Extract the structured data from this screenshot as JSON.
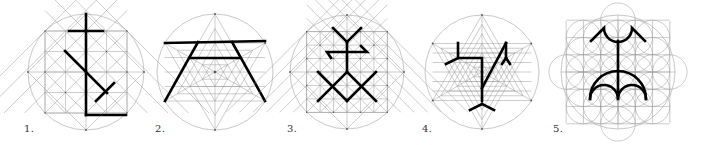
{
  "figures": [
    {
      "id": 1,
      "label": "1.",
      "cx": 86,
      "cy": 72,
      "r": 58,
      "construction": "octagonal-square-grid",
      "label_pos": [
        24,
        123
      ]
    },
    {
      "id": 2,
      "label": "2.",
      "cx": 215,
      "cy": 72,
      "r": 58,
      "construction": "hexagram-triangular-grid",
      "label_pos": [
        155,
        123
      ]
    },
    {
      "id": 3,
      "label": "3.",
      "cx": 347,
      "cy": 72,
      "r": 57,
      "construction": "octagonal-square-grid-fine",
      "label_pos": [
        287,
        123
      ]
    },
    {
      "id": 4,
      "label": "4.",
      "cx": 482,
      "cy": 72,
      "r": 57,
      "construction": "hexagram-triangular-grid-fine",
      "label_pos": [
        422,
        123
      ]
    },
    {
      "id": 5,
      "label": "5.",
      "cx": 618,
      "cy": 72,
      "r": 57,
      "construction": "flower-of-life-circles",
      "label_pos": [
        553,
        123
      ]
    }
  ],
  "colors": {
    "background": "#ffffff",
    "guide_lines": "#9a9a9a",
    "glyph_stroke": "#000000",
    "label_text": "#333333"
  }
}
